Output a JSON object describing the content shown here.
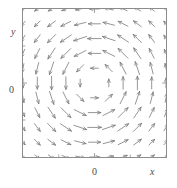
{
  "figure": {
    "title": "",
    "frame": {
      "left": 22,
      "top": 8,
      "width": 145,
      "height": 150
    }
  },
  "labels": {
    "x_axis": "x",
    "y_axis": "y",
    "x_tick_zero": "0",
    "y_tick_zero": "0"
  },
  "colors": {
    "arrow": "#7a7a7a",
    "frame": "#8c8c8c",
    "text": "#4a4a4a",
    "background": "#ffffff"
  },
  "chart_data": {
    "type": "scatter",
    "plot_kind": "vector-field-quiver",
    "title": "",
    "xlabel": "x",
    "ylabel": "y",
    "xlim": [
      -1,
      1
    ],
    "ylim": [
      -1,
      1
    ],
    "xticks": [
      0
    ],
    "xticklabels": [
      "0"
    ],
    "yticks": [
      0
    ],
    "yticklabels": [
      "0"
    ],
    "grid": false,
    "legend": null,
    "field": {
      "u_formula": "-y * f(r)",
      "v_formula": "x * f(r)",
      "rotation": "counterclockwise",
      "grid_nx": 11,
      "grid_ny": 11,
      "x_samples": [
        -1.0,
        -0.8,
        -0.6,
        -0.4,
        -0.2,
        0.0,
        0.2,
        0.4,
        0.6,
        0.8,
        1.0
      ],
      "y_samples": [
        -1.0,
        -0.8,
        -0.6,
        -0.4,
        -0.2,
        0.0,
        0.2,
        0.4,
        0.6,
        0.8,
        1.0
      ],
      "magnitude_profile": {
        "radius": [
          0.0,
          0.2,
          0.35,
          0.5,
          0.7,
          0.9,
          1.1,
          1.3,
          1.42
        ],
        "magnitude": [
          0.0,
          0.55,
          0.85,
          1.0,
          0.95,
          0.78,
          0.6,
          0.45,
          0.38
        ]
      },
      "max_arrow_length_px": 14,
      "arrowhead_length_px": 3.6
    }
  }
}
